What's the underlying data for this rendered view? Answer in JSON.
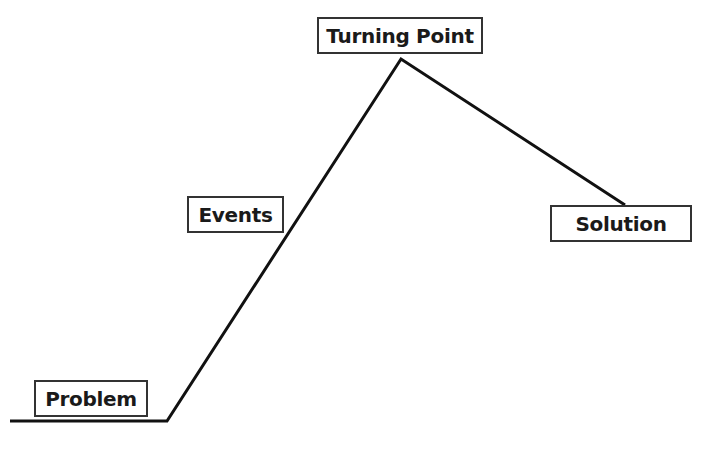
{
  "diagram": {
    "type": "plot-line",
    "labels": {
      "problem": "Problem",
      "events": "Events",
      "turning_point": "Turning Point",
      "solution": "Solution"
    },
    "line_points": [
      [
        10,
        421
      ],
      [
        167,
        421
      ],
      [
        401,
        59
      ],
      [
        625,
        205
      ]
    ],
    "colors": {
      "line": "#111111",
      "box_border": "#333333",
      "text": "#1a1a1a",
      "background": "#ffffff"
    }
  }
}
